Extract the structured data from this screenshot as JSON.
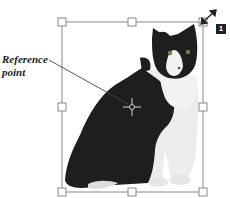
{
  "callout": {
    "line1": "Reference",
    "line2": "point"
  },
  "badge": {
    "number": "1"
  },
  "object": {
    "type": "image",
    "subject": "black-and-white cat",
    "selected": true
  },
  "icons": {
    "rotate_cursor": "diagonal-resize-arrow-icon",
    "reference_point": "crosshair-reference-point-icon"
  },
  "colors": {
    "frame": "#8a8a8a",
    "handle_fill": "#ffffff",
    "cat_dark": "#1e1e1e",
    "cat_light": "#efefef",
    "badge_bg": "#222222"
  }
}
